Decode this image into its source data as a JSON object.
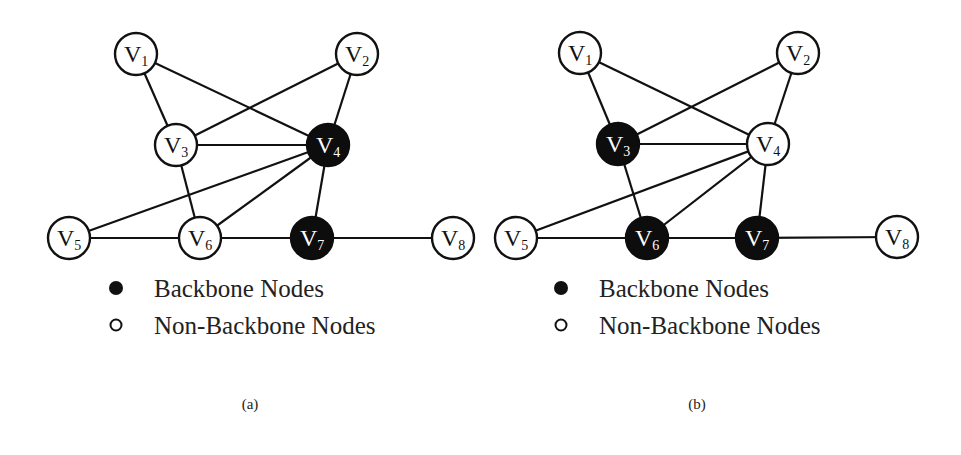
{
  "figure": {
    "edges": [
      [
        "V1",
        "V3"
      ],
      [
        "V1",
        "V4"
      ],
      [
        "V2",
        "V3"
      ],
      [
        "V2",
        "V4"
      ],
      [
        "V3",
        "V4"
      ],
      [
        "V3",
        "V6"
      ],
      [
        "V4",
        "V5"
      ],
      [
        "V4",
        "V6"
      ],
      [
        "V4",
        "V7"
      ],
      [
        "V5",
        "V6"
      ],
      [
        "V6",
        "V7"
      ],
      [
        "V7",
        "V8"
      ]
    ],
    "legend": {
      "backbone_label": "Backbone Nodes",
      "non_backbone_label": "Non-Backbone Nodes"
    },
    "panels": [
      {
        "id": "a",
        "caption": "(a)",
        "backbone_nodes": [
          "V4",
          "V7"
        ],
        "nodes": [
          {
            "id": "V1",
            "label": "V",
            "sub": "1",
            "x": 136,
            "y": 54
          },
          {
            "id": "V2",
            "label": "V",
            "sub": "2",
            "x": 357,
            "y": 54
          },
          {
            "id": "V3",
            "label": "V",
            "sub": "3",
            "x": 176,
            "y": 145
          },
          {
            "id": "V4",
            "label": "V",
            "sub": "4",
            "x": 328,
            "y": 145
          },
          {
            "id": "V5",
            "label": "V",
            "sub": "5",
            "x": 69,
            "y": 238
          },
          {
            "id": "V6",
            "label": "V",
            "sub": "6",
            "x": 200,
            "y": 238
          },
          {
            "id": "V7",
            "label": "V",
            "sub": "7",
            "x": 312,
            "y": 238
          },
          {
            "id": "V8",
            "label": "V",
            "sub": "8",
            "x": 453,
            "y": 238
          }
        ],
        "legend_pos": {
          "x": 116,
          "y": 288
        },
        "caption_pos": {
          "x": 250,
          "y": 409
        }
      },
      {
        "id": "b",
        "caption": "(b)",
        "backbone_nodes": [
          "V3",
          "V6",
          "V7"
        ],
        "nodes": [
          {
            "id": "V1",
            "label": "V",
            "sub": "1",
            "x": 580,
            "y": 53
          },
          {
            "id": "V2",
            "label": "V",
            "sub": "2",
            "x": 798,
            "y": 53
          },
          {
            "id": "V3",
            "label": "V",
            "sub": "3",
            "x": 618,
            "y": 144
          },
          {
            "id": "V4",
            "label": "V",
            "sub": "4",
            "x": 768,
            "y": 144
          },
          {
            "id": "V5",
            "label": "V",
            "sub": "5",
            "x": 516,
            "y": 238
          },
          {
            "id": "V6",
            "label": "V",
            "sub": "6",
            "x": 647,
            "y": 238
          },
          {
            "id": "V7",
            "label": "V",
            "sub": "7",
            "x": 757,
            "y": 238
          },
          {
            "id": "V8",
            "label": "V",
            "sub": "8",
            "x": 897,
            "y": 237
          }
        ],
        "legend_pos": {
          "x": 561,
          "y": 288
        },
        "caption_pos": {
          "x": 697,
          "y": 409
        }
      }
    ],
    "colors": {
      "backbone": "#0d0d0d",
      "non_backbone": "#ffffff",
      "edge": "#111111"
    }
  }
}
